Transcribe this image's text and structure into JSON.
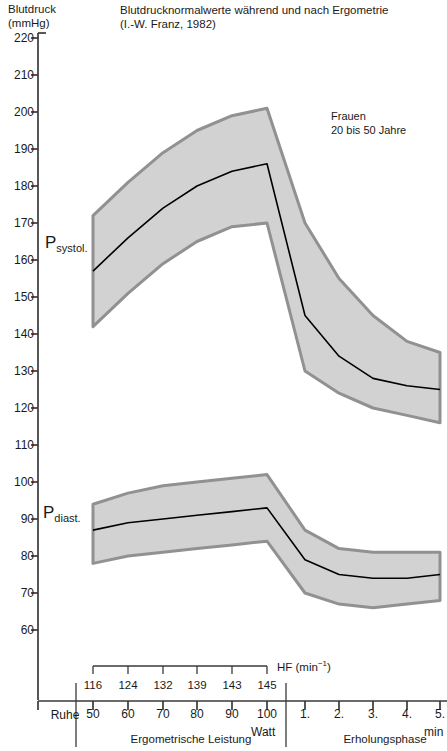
{
  "axis_title": "Blutdruck\n(mmHg)",
  "title": "Blutdrucknormalwerte  während und nach Ergometrie",
  "subtitle": "(I.-W. Franz, 1982)",
  "annotation": "Frauen\n20 bis 50 Jahre",
  "labels": {
    "systolic_p": "P",
    "systolic_sub": "systol.",
    "diastolic_p": "P",
    "diastolic_sub": "diast.",
    "hf": "HF (min",
    "hf_exp": "−1",
    "hf_close": ")",
    "rest": "Ruhe",
    "watt": "Watt",
    "min": "min",
    "phase_exercise": "Ergometrische Leistung",
    "phase_recovery": "Erholungsphase"
  },
  "colors": {
    "band_fill": "#d2d2d2",
    "band_stroke": "#919191",
    "mean_line": "#000000",
    "axis": "#3a3a3a",
    "text": "#1a1a1a",
    "background": "#ffffff"
  },
  "chart_data": {
    "type": "area",
    "title": "Blutdrucknormalwerte während und nach Ergometrie",
    "subtitle": "(I.-W. Franz, 1982)",
    "annotation": "Frauen, 20 bis 50 Jahre",
    "ylabel": "Blutdruck (mmHg)",
    "xlabel": "Ergometrische Leistung / Erholungsphase",
    "ylim": [
      55,
      225
    ],
    "yticks": [
      220,
      210,
      200,
      190,
      180,
      170,
      160,
      150,
      140,
      130,
      120,
      110,
      100,
      90,
      80,
      70,
      60
    ],
    "grid": false,
    "legend": "none",
    "x_categories": [
      "Ruhe",
      "50",
      "60",
      "70",
      "80",
      "90",
      "100",
      "1.",
      "2.",
      "3.",
      "4.",
      "5."
    ],
    "x_units": [
      "",
      "Watt",
      "Watt",
      "Watt",
      "Watt",
      "Watt",
      "Watt",
      "min",
      "min",
      "min",
      "min",
      "min"
    ],
    "heart_rate_row": {
      "label": "HF (min−1)",
      "categories": [
        "50",
        "60",
        "70",
        "80",
        "90",
        "100"
      ],
      "values": [
        116,
        124,
        132,
        139,
        143,
        145
      ]
    },
    "series": [
      {
        "name": "P systol. Mittelwert",
        "x": [
          "50",
          "60",
          "70",
          "80",
          "90",
          "100",
          "1.",
          "2.",
          "3.",
          "4.",
          "5."
        ],
        "values": [
          157,
          166,
          174,
          180,
          184,
          186,
          145,
          134,
          128,
          126,
          125
        ]
      },
      {
        "name": "P systol. obere Grenze",
        "x": [
          "50",
          "60",
          "70",
          "80",
          "90",
          "100",
          "1.",
          "2.",
          "3.",
          "4.",
          "5."
        ],
        "values": [
          172,
          181,
          189,
          195,
          199,
          201,
          170,
          155,
          145,
          138,
          135
        ]
      },
      {
        "name": "P systol. untere Grenze",
        "x": [
          "50",
          "60",
          "70",
          "80",
          "90",
          "100",
          "1.",
          "2.",
          "3.",
          "4.",
          "5."
        ],
        "values": [
          142,
          151,
          159,
          165,
          169,
          170,
          130,
          124,
          120,
          118,
          116
        ]
      },
      {
        "name": "P diast. Mittelwert",
        "x": [
          "50",
          "60",
          "70",
          "80",
          "90",
          "100",
          "1.",
          "2.",
          "3.",
          "4.",
          "5."
        ],
        "values": [
          87,
          89,
          90,
          91,
          92,
          93,
          79,
          75,
          74,
          74,
          75
        ]
      },
      {
        "name": "P diast. obere Grenze",
        "x": [
          "50",
          "60",
          "70",
          "80",
          "90",
          "100",
          "1.",
          "2.",
          "3.",
          "4.",
          "5."
        ],
        "values": [
          94,
          97,
          99,
          100,
          101,
          102,
          87,
          82,
          81,
          81,
          81
        ]
      },
      {
        "name": "P diast. untere Grenze",
        "x": [
          "50",
          "60",
          "70",
          "80",
          "90",
          "100",
          "1.",
          "2.",
          "3.",
          "4.",
          "5."
        ],
        "values": [
          78,
          80,
          81,
          82,
          83,
          84,
          70,
          67,
          66,
          67,
          68
        ]
      }
    ]
  }
}
